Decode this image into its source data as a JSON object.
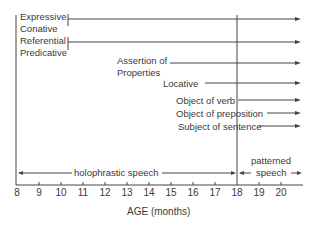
{
  "diagram": {
    "functions": [
      {
        "id": "expressive",
        "label": "Expressive"
      },
      {
        "id": "conative",
        "label": "Conative"
      },
      {
        "id": "referential",
        "label": "Referential"
      },
      {
        "id": "predicative",
        "label": "Predicative"
      },
      {
        "id": "assertion1",
        "label": "Assertion of"
      },
      {
        "id": "assertion2",
        "label": "Properties"
      },
      {
        "id": "locative",
        "label": "Locative"
      },
      {
        "id": "object_verb",
        "label": "Object of verb"
      },
      {
        "id": "object_prep",
        "label": "Object of preposition"
      },
      {
        "id": "subject",
        "label": "Subject of sentence"
      }
    ],
    "periods": {
      "holophrastic": "holophrastic speech",
      "patterned1": "patterned",
      "patterned2": "speech"
    },
    "axis": {
      "label": "AGE (months)",
      "ticks": [
        "8",
        "9",
        "10",
        "11",
        "12",
        "13",
        "14",
        "15",
        "16",
        "17",
        "18",
        "19",
        "20"
      ]
    }
  }
}
